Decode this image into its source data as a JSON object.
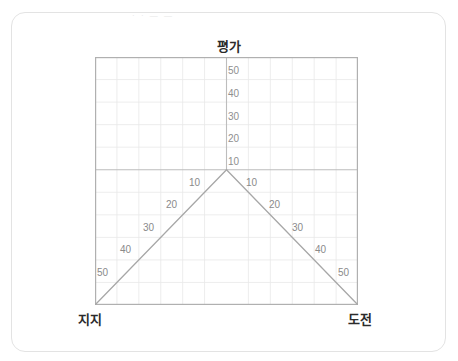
{
  "page": {
    "background": "#ffffff",
    "card_border_color": "#e3e3e3",
    "faint_top_text": "· · — —"
  },
  "axes": {
    "top_label": "평가",
    "bottom_left_label": "지지",
    "bottom_right_label": "도전"
  },
  "chart_data": {
    "type": "line",
    "title": "평가",
    "xlabel": "",
    "ylabel": "",
    "grid": true,
    "legend": "none",
    "vertical_axis": {
      "label": "평가",
      "ticks": [
        50,
        40,
        30,
        20,
        10
      ],
      "tick_labels": [
        "50",
        "40",
        "30",
        "20",
        "10"
      ]
    },
    "left_diagonal_axis": {
      "label": "지지",
      "ticks": [
        10,
        20,
        30,
        40,
        50
      ],
      "tick_labels": [
        "10",
        "20",
        "30",
        "40",
        "50"
      ]
    },
    "right_diagonal_axis": {
      "label": "도전",
      "ticks": [
        10,
        20,
        30,
        40,
        50
      ],
      "tick_labels": [
        "10",
        "20",
        "30",
        "40",
        "50"
      ]
    },
    "series": [
      {
        "name": "지지-평가 diagonal",
        "x": [
          0,
          6
        ],
        "y": [
          0,
          6
        ]
      },
      {
        "name": "평가-도전 diagonal",
        "x": [
          6,
          12
        ],
        "y": [
          6,
          0
        ]
      }
    ],
    "grid_columns": 12,
    "grid_rows": 11,
    "apex_column": 6,
    "apex_row": 5,
    "xlim": [
      0,
      12
    ],
    "ylim": [
      0,
      11
    ]
  },
  "ticks": {
    "vertical": [
      {
        "text": "50",
        "left": 228,
        "top": 66
      },
      {
        "text": "40",
        "left": 228,
        "top": 89
      },
      {
        "text": "30",
        "left": 228,
        "top": 112
      },
      {
        "text": "20",
        "left": 228,
        "top": 134
      },
      {
        "text": "10",
        "left": 228,
        "top": 157
      }
    ],
    "left_diagonal": [
      {
        "text": "10",
        "left": 189,
        "top": 178
      },
      {
        "text": "20",
        "left": 166,
        "top": 200
      },
      {
        "text": "30",
        "left": 143,
        "top": 223
      },
      {
        "text": "40",
        "left": 120,
        "top": 245
      },
      {
        "text": "50",
        "left": 97,
        "top": 268
      }
    ],
    "right_diagonal": [
      {
        "text": "10",
        "left": 246,
        "top": 178
      },
      {
        "text": "20",
        "left": 269,
        "top": 200
      },
      {
        "text": "30",
        "left": 292,
        "top": 223
      },
      {
        "text": "40",
        "left": 315,
        "top": 245
      },
      {
        "text": "50",
        "left": 338,
        "top": 268
      }
    ]
  }
}
